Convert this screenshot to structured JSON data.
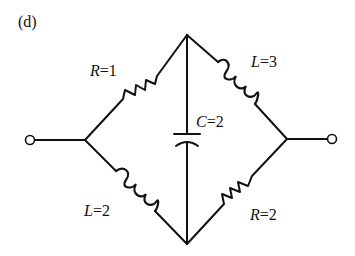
{
  "figure": {
    "panel_label": "(d)",
    "type": "AC bridge circuit diagram"
  },
  "components": [
    {
      "id": "R1",
      "kind": "resistor",
      "symbol": "R",
      "value": "1",
      "branch": "left-node to top-node"
    },
    {
      "id": "L3",
      "kind": "inductor",
      "symbol": "L",
      "value": "3",
      "branch": "top-node to right-node"
    },
    {
      "id": "C2",
      "kind": "capacitor",
      "symbol": "C",
      "value": "2",
      "branch": "top-node to bottom-node"
    },
    {
      "id": "L2",
      "kind": "inductor",
      "symbol": "L",
      "value": "2",
      "branch": "left-node to bottom-node"
    },
    {
      "id": "R2",
      "kind": "resistor",
      "symbol": "R",
      "value": "2",
      "branch": "bottom-node to right-node"
    }
  ],
  "labels": {
    "r1": {
      "symbol": "R",
      "eq": "=1"
    },
    "l3": {
      "symbol": "L",
      "eq": "=3"
    },
    "c2": {
      "symbol": "C",
      "eq": "=2"
    },
    "l2": {
      "symbol": "L",
      "eq": "=2"
    },
    "r2": {
      "symbol": "R",
      "eq": "=2"
    }
  },
  "terminals": [
    {
      "id": "input",
      "side": "left"
    },
    {
      "id": "output",
      "side": "right"
    }
  ],
  "colors": {
    "ink": "#111111",
    "background": "#ffffff"
  }
}
